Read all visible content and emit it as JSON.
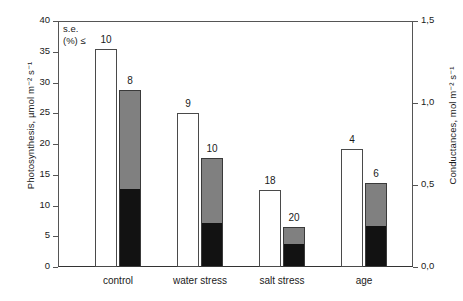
{
  "chart_data": {
    "type": "bar",
    "title": "",
    "subtitle": "",
    "categories": [
      "control",
      "water stress",
      "salt stress",
      "age"
    ],
    "series": [
      {
        "name": "Photosynthesis (open bars)",
        "axis": "left",
        "style": "open-white",
        "values": [
          35.5,
          25.0,
          12.5,
          19.2
        ],
        "data_labels": [
          "10",
          "9",
          "18",
          "4"
        ]
      },
      {
        "name": "Conductance total (stacked bar top)",
        "axis": "left",
        "style": "stacked-gray-over-black",
        "values": [
          28.8,
          17.8,
          6.5,
          13.6
        ],
        "lower_values": [
          12.5,
          7.0,
          3.5,
          6.5
        ],
        "data_labels": [
          "8",
          "10",
          "20",
          "6"
        ]
      }
    ],
    "xlabel": "",
    "ylabel": "Photosynthesis, µmol m⁻² s⁻¹",
    "y2label": "Conductances, mol m⁻² s⁻¹",
    "ylim": [
      0,
      40
    ],
    "y2lim": [
      0.0,
      1.5
    ],
    "yticks": [
      "0",
      "5",
      "10",
      "15",
      "20",
      "25",
      "30",
      "35",
      "40"
    ],
    "ytick_values": [
      0,
      5,
      10,
      15,
      20,
      25,
      30,
      35,
      40
    ],
    "y2ticks": [
      "0,0",
      "0,5",
      "1,0",
      "1,5"
    ],
    "y2tick_values": [
      0.0,
      0.5,
      1.0,
      1.5
    ],
    "grid": false,
    "legend": "none",
    "annotations": [
      {
        "name": "standard-error-note",
        "line1": "s.e.",
        "line2": "(%) ≤"
      }
    ],
    "colors": {
      "open_bar_fill": "#ffffff",
      "open_bar_stroke": "#4a4a4a",
      "upper_segment": "#808080",
      "lower_segment": "#121212",
      "axis": "#555555",
      "text": "#1a1a1a",
      "background": "#ffffff"
    }
  }
}
